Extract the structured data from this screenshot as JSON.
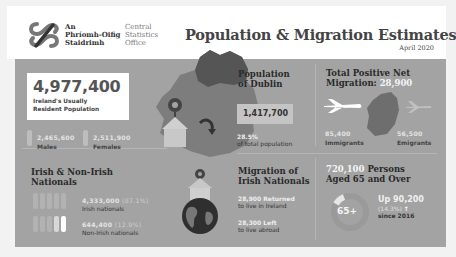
{
  "header": {
    "logo_irish": [
      "An",
      "Phríomh-Oifig",
      "Staidrimh"
    ],
    "logo_english": [
      "Central",
      "Statistics",
      "Office"
    ],
    "title": "Population & Migration Estimates",
    "subtitle": "April 2020"
  },
  "population": {
    "value": "4,977,400",
    "label_line1": "Ireland's Usually",
    "label_line2": "Resident Population",
    "males_value": "2,465,600",
    "males_label": "Males",
    "females_value": "2,511,900",
    "females_label": "Females"
  },
  "dublin": {
    "title_line1": "Population",
    "title_line2": "of Dublin",
    "value": "1,417,700",
    "percent": "28.5%",
    "percent_label": "of total population"
  },
  "net_migration": {
    "title_line1": "Total Positive Net",
    "title_line2": "Migration:",
    "value": "28,900",
    "immigrants_value": "85,400",
    "immigrants_label": "Immigrants",
    "emigrants_value": "56,500",
    "emigrants_label": "Emigrants"
  },
  "nationals": {
    "title_line1": "Irish & Non-Irish",
    "title_line2": "Nationals",
    "irish_value": "4,333,000",
    "irish_pct": "(87.1%)",
    "irish_label": "Irish nationals",
    "nonirish_value": "644,400",
    "nonirish_pct": "(12.9%)",
    "nonirish_label": "Non-Irish nationals"
  },
  "irish_migration": {
    "title_line1": "Migration of",
    "title_line2": "Irish Nationals",
    "returned_value": "28,900",
    "returned_word": "Returned",
    "returned_label": "to live in Ireland",
    "left_value": "28,300",
    "left_word": "Left",
    "left_label": "to live abroad"
  },
  "aged65": {
    "value": "720,100",
    "title_rest": "Persons",
    "title_line2": "Aged 65 and Over",
    "badge": "65+",
    "up_label": "Up 90,200",
    "up_pct": "(14.3%)",
    "arrow": "↑",
    "since": "since 2016"
  },
  "colors": {
    "panel": "#a3a3a3",
    "header_bg": "#ffffff",
    "title": "#444444",
    "highlight": "#eeeeee"
  }
}
